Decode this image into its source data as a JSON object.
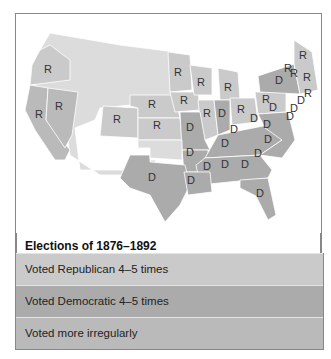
{
  "title": "Elections of 1876–1892",
  "legend": [
    {
      "label": "Voted Republican 4–5 times",
      "color": "#cacaca"
    },
    {
      "label": "Voted Democratic 4–5 times",
      "color": "#ababab"
    },
    {
      "label": "Voted more irregularly",
      "color": "#bababa"
    }
  ],
  "map_colors": {
    "republican": "#cacaca",
    "democratic": "#ababab",
    "territory": "#dcdcdc",
    "irregular": "#bababa"
  },
  "state_labels": [
    {
      "t": "R",
      "x": 48,
      "y": 73
    },
    {
      "t": "R",
      "x": 39,
      "y": 118
    },
    {
      "t": "R",
      "x": 59,
      "y": 110
    },
    {
      "t": "R",
      "x": 117,
      "y": 123
    },
    {
      "t": "R",
      "x": 152,
      "y": 108
    },
    {
      "t": "R",
      "x": 184,
      "y": 104
    },
    {
      "t": "R",
      "x": 157,
      "y": 129
    },
    {
      "t": "R",
      "x": 178,
      "y": 76
    },
    {
      "t": "R",
      "x": 201,
      "y": 86
    },
    {
      "t": "R",
      "x": 228,
      "y": 91
    },
    {
      "t": "R",
      "x": 207,
      "y": 117
    },
    {
      "t": "D",
      "x": 222,
      "y": 117
    },
    {
      "t": "R",
      "x": 241,
      "y": 113
    },
    {
      "t": "R",
      "x": 266,
      "y": 103
    },
    {
      "t": "D",
      "x": 279,
      "y": 84
    },
    {
      "t": "R",
      "x": 303,
      "y": 59
    },
    {
      "t": "R",
      "x": 288,
      "y": 72
    },
    {
      "t": "R",
      "x": 294,
      "y": 77
    },
    {
      "t": "R",
      "x": 307,
      "y": 81
    },
    {
      "t": "R",
      "x": 308,
      "y": 97
    },
    {
      "t": "D",
      "x": 301,
      "y": 104
    },
    {
      "t": "D",
      "x": 273,
      "y": 111
    },
    {
      "t": "D",
      "x": 294,
      "y": 112
    },
    {
      "t": "D",
      "x": 290,
      "y": 120
    },
    {
      "t": "D",
      "x": 254,
      "y": 122
    },
    {
      "t": "D",
      "x": 267,
      "y": 128
    },
    {
      "t": "D",
      "x": 190,
      "y": 131
    },
    {
      "t": "D",
      "x": 234,
      "y": 133
    },
    {
      "t": "D",
      "x": 268,
      "y": 143
    },
    {
      "t": "D",
      "x": 225,
      "y": 147
    },
    {
      "t": "D",
      "x": 190,
      "y": 156
    },
    {
      "t": "D",
      "x": 258,
      "y": 157
    },
    {
      "t": "D",
      "x": 207,
      "y": 170
    },
    {
      "t": "D",
      "x": 225,
      "y": 168
    },
    {
      "t": "D",
      "x": 245,
      "y": 168
    },
    {
      "t": "D",
      "x": 152,
      "y": 181
    },
    {
      "t": "D",
      "x": 191,
      "y": 184
    },
    {
      "t": "D",
      "x": 260,
      "y": 197
    }
  ]
}
